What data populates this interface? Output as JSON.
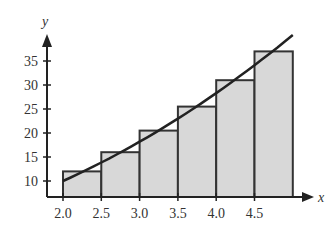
{
  "chart_data": {
    "type": "bar",
    "title": "",
    "xlabel": "x",
    "ylabel": "y",
    "x_ticks": [
      "2.0",
      "2.5",
      "3.0",
      "3.5",
      "4.0",
      "4.5"
    ],
    "y_ticks": [
      "10",
      "15",
      "20",
      "25",
      "30",
      "35"
    ],
    "bars": [
      {
        "x_start": 2.0,
        "x_end": 2.5,
        "height": 12
      },
      {
        "x_start": 2.5,
        "x_end": 3.0,
        "height": 16
      },
      {
        "x_start": 3.0,
        "x_end": 3.5,
        "height": 20.5
      },
      {
        "x_start": 3.5,
        "x_end": 4.0,
        "height": 25.5
      },
      {
        "x_start": 4.0,
        "x_end": 4.5,
        "height": 31
      },
      {
        "x_start": 4.5,
        "x_end": 5.0,
        "height": 37
      }
    ],
    "curve": {
      "x": [
        2.0,
        5.0
      ],
      "y": [
        10,
        40.5
      ],
      "description": "increasing curve through bar tops (right-endpoint rectangles)"
    },
    "xlim": [
      2.0,
      5.0
    ],
    "ylim": [
      7,
      40
    ],
    "grid": false,
    "bar_fill": "#d8d8d8",
    "line_color": "#222222"
  }
}
